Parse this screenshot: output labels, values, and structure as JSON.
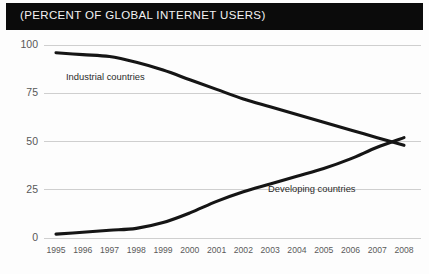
{
  "header": {
    "title": "(PERCENT OF GLOBAL INTERNET USERS)"
  },
  "chart_data": {
    "type": "line",
    "title": "(PERCENT OF GLOBAL INTERNET USERS)",
    "xlabel": "",
    "ylabel": "",
    "ylim": [
      0,
      100
    ],
    "yticks": [
      "0",
      "25",
      "50",
      "75",
      "100"
    ],
    "grid": true,
    "legend_position": "inline-labels",
    "categories": [
      "1995",
      "1996",
      "1997",
      "1998",
      "1999",
      "2000",
      "2001",
      "2002",
      "2003",
      "2004",
      "2005",
      "2006",
      "2007",
      "2008"
    ],
    "series": [
      {
        "name": "Industrial countries",
        "color": "#151515",
        "values": [
          96,
          95,
          94,
          91,
          87,
          82,
          77,
          72,
          68,
          64,
          60,
          56,
          52,
          48
        ]
      },
      {
        "name": "Developing countries",
        "color": "#151515",
        "values": [
          2,
          3,
          4,
          5,
          8,
          13,
          19,
          24,
          28,
          32,
          36,
          41,
          47,
          52
        ]
      }
    ],
    "annotations": [
      {
        "text": "Industrial countries",
        "near_year": "1997"
      },
      {
        "text": "Developing countries",
        "near_year": "2004"
      }
    ]
  }
}
